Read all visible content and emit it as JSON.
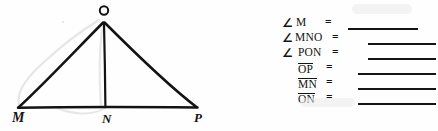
{
  "figure": {
    "name": "triangle-MOP-with-altitude-ON",
    "vertices": [
      {
        "label": "O",
        "x": 104,
        "y": 16
      },
      {
        "label": "M",
        "x": 18,
        "y": 108
      },
      {
        "label": "N",
        "x": 106,
        "y": 108
      },
      {
        "label": "P",
        "x": 197,
        "y": 108
      }
    ],
    "segments": [
      {
        "name": "MO",
        "from": "M",
        "to": "O"
      },
      {
        "name": "OP",
        "from": "O",
        "to": "P"
      },
      {
        "name": "MP",
        "from": "M",
        "to": "P"
      },
      {
        "name": "ON",
        "from": "O",
        "to": "N"
      }
    ]
  },
  "answers": {
    "title": "",
    "rows": [
      {
        "id": "row-angle-M",
        "angle": true,
        "term": "M",
        "underlined": false,
        "equals": "=",
        "blank": true
      },
      {
        "id": "row-angle-MNO",
        "angle": true,
        "term": "MNO",
        "underlined": false,
        "equals": "=",
        "blank": true
      },
      {
        "id": "row-angle-PON",
        "angle": true,
        "term": "PON",
        "underlined": false,
        "equals": "=",
        "blank": true
      },
      {
        "id": "row-seg-OP",
        "angle": false,
        "term": "OP",
        "underlined": true,
        "equals": "=",
        "blank": true
      },
      {
        "id": "row-seg-MN",
        "angle": false,
        "term": "MN",
        "underlined": true,
        "equals": "=",
        "blank": true
      },
      {
        "id": "row-seg-ON",
        "angle": false,
        "term": "ON",
        "underlined": true,
        "equals": "=",
        "blank": true
      }
    ],
    "angle_symbol": "∠"
  },
  "colors": {
    "ink": "#131313",
    "paper": "#fefefe",
    "pencil_smudge": "#d7d7d7"
  }
}
